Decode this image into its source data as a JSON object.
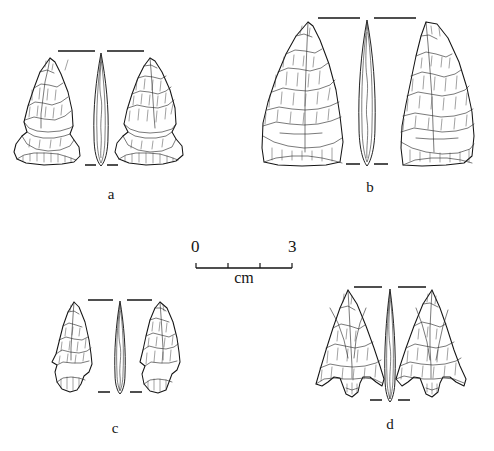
{
  "figure": {
    "type": "archaeological-illustration-plate",
    "background_color": "#ffffff",
    "ink_color": "#151515",
    "width": 494,
    "height": 451
  },
  "scale": {
    "start_label": "0",
    "end_label": "3",
    "unit_label": "cm",
    "minor_ticks": 2,
    "bar_left": 196,
    "bar_right": 292,
    "bar_y": 268
  },
  "specimens": [
    {
      "id": "a",
      "label": "a",
      "label_x": 96,
      "label_y": 187,
      "x": 10,
      "y": 40,
      "width": 182,
      "height": 135,
      "form": "side-notched expanding-stem point",
      "views": [
        "obverse",
        "profile",
        "reverse"
      ]
    },
    {
      "id": "b",
      "label": "b",
      "label_x": 355,
      "label_y": 180,
      "x": 250,
      "y": 8,
      "width": 230,
      "height": 165,
      "form": "triangular lanceolate biface with straight base",
      "views": [
        "obverse",
        "profile",
        "reverse"
      ]
    },
    {
      "id": "c",
      "label": "c",
      "label_x": 100,
      "label_y": 421,
      "x": 48,
      "y": 292,
      "width": 148,
      "height": 105,
      "form": "small side-notched point",
      "views": [
        "obverse",
        "profile",
        "reverse"
      ]
    },
    {
      "id": "d",
      "label": "d",
      "label_x": 375,
      "label_y": 417,
      "x": 310,
      "y": 278,
      "width": 176,
      "height": 128,
      "form": "corner-notched barbed point with short stem",
      "views": [
        "obverse",
        "profile",
        "reverse"
      ]
    }
  ]
}
